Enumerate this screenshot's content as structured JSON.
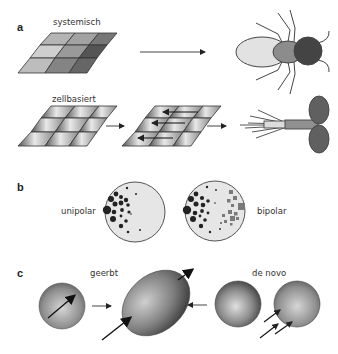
{
  "panels": {
    "a": {
      "label": "a",
      "rows": [
        {
          "caption": "systemisch",
          "result": "insect-like organism (anterior-posterior body plan)"
        },
        {
          "caption": "zellbasiert",
          "result": "planar-polarized tissue / hair cell"
        }
      ]
    },
    "b": {
      "label": "b",
      "cells": [
        {
          "caption": "unipolar"
        },
        {
          "caption": "bipolar"
        }
      ]
    },
    "c": {
      "label": "c",
      "captions": {
        "inherited": "geerbt",
        "de_novo": "de novo"
      }
    }
  },
  "colors": {
    "stroke": "#333333",
    "grid_light": "#cfcfcf",
    "grid_mid": "#9a9a9a",
    "grid_dark": "#555555",
    "head_dark": "#444444",
    "thorax": "#8c8c8c",
    "abdomen": "#e2e2e2",
    "cell_bg": "#e6e6e6",
    "dot": "#222222",
    "square": "#7a7a7a"
  }
}
